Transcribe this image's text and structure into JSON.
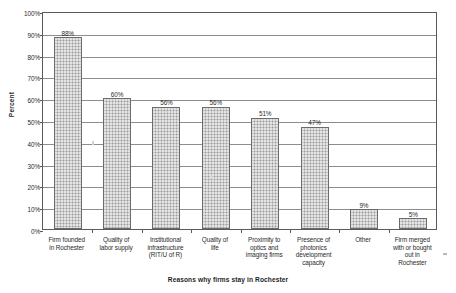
{
  "chart_data": {
    "type": "bar",
    "title": "",
    "xlabel": "Reasons why firms stay in Rochester",
    "ylabel": "Percent",
    "ylim": [
      0,
      100
    ],
    "grid": true,
    "legend": "none",
    "categories": [
      "Firm founded in Rochester",
      "Quality of labor supply",
      "Institutional infrastructure (RIT/U of R)",
      "Quality of life",
      "Proximity to optics and imaging firms",
      "Presence of photonics development capacity",
      "Other",
      "Firm merged with or bought out in Rochester"
    ],
    "category_lines": [
      [
        "Firm founded",
        "in Rochester"
      ],
      [
        "Quality of",
        "labor supply"
      ],
      [
        "Institutional",
        "infrastructure",
        "(RIT/U of R)"
      ],
      [
        "Quality of",
        "life"
      ],
      [
        "Proximity to",
        "optics and",
        "imaging firms"
      ],
      [
        "Presence of",
        "photonics",
        "development",
        "capacity"
      ],
      [
        "Other"
      ],
      [
        "Firm merged",
        "with or bought",
        "out in",
        "Rochester"
      ]
    ],
    "values": [
      88,
      60,
      56,
      56,
      51,
      47,
      9,
      5
    ],
    "value_labels": [
      "88%",
      "60%",
      "56%",
      "56%",
      "51%",
      "47%",
      "9%",
      "5%"
    ],
    "y_ticks": [
      0,
      10,
      20,
      30,
      40,
      50,
      60,
      70,
      80,
      90,
      100
    ],
    "y_tick_labels": [
      "0%",
      "10%",
      "20%",
      "30%",
      "40%",
      "50%",
      "60%",
      "70%",
      "80%",
      "90%",
      "100%"
    ],
    "colors": {
      "bar_fill": "#c3c3c3",
      "bar_border": "#6b6b6b",
      "gridline": "#8d8d8d",
      "axis": "#5a5a5a",
      "text": "#2b2b2b",
      "background": "#ffffff"
    }
  }
}
